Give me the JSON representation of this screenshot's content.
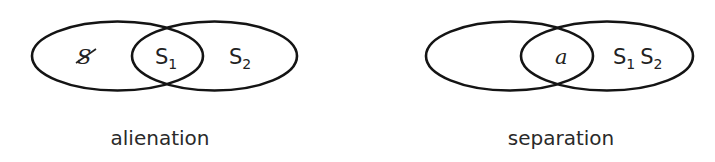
{
  "diagrams": [
    {
      "caption": "alienation",
      "left_set": {
        "label": "S",
        "barred": true
      },
      "intersection": {
        "label": "S",
        "subscript": "1"
      },
      "right_set": {
        "label": "S",
        "subscript": "2"
      }
    },
    {
      "caption": "separation",
      "left_set": {
        "label": ""
      },
      "intersection": {
        "label": "a",
        "italic": true
      },
      "right_set": {
        "items": [
          {
            "label": "S",
            "subscript": "1"
          },
          {
            "label": "S",
            "subscript": "2"
          }
        ]
      }
    }
  ]
}
